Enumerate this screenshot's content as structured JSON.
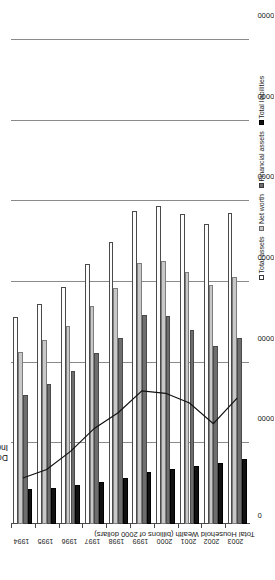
{
  "chart_data": {
    "type": "bar",
    "orientation": "horizontal-rotated",
    "title": "",
    "xlabel": "",
    "ylabel": "Total Household Wealth (billions of 2000 dollars)",
    "categories": [
      "1994",
      "1995",
      "1996",
      "1997",
      "1998",
      "1999",
      "2000",
      "2001",
      "2002",
      "2003"
    ],
    "ylim": [
      0,
      60000
    ],
    "yticks": [
      0,
      10000,
      20000,
      30000,
      40000,
      50000,
      60000
    ],
    "ytick_labels": [
      "0",
      "10000",
      "20000",
      "30000",
      "40000",
      "50000",
      "60000"
    ],
    "grid": true,
    "legend_position": "bottom-right",
    "series": [
      {
        "name": "Total assets",
        "swatch": "s0",
        "values": [
          25600,
          27300,
          29400,
          32200,
          35000,
          38800,
          39400,
          38400,
          37200,
          38600
        ]
      },
      {
        "name": "Net worth",
        "swatch": "s1",
        "values": [
          21300,
          22800,
          24600,
          27000,
          29300,
          32400,
          32600,
          31200,
          29600,
          30600
        ]
      },
      {
        "name": "Financial assets",
        "swatch": "s2",
        "values": [
          16000,
          17400,
          19000,
          21200,
          23100,
          25900,
          25800,
          24000,
          22100,
          23000
        ]
      },
      {
        "name": "Total liabilities",
        "swatch": "s3",
        "values": [
          4300,
          4500,
          4800,
          5200,
          5700,
          6400,
          6800,
          7200,
          7600,
          8000
        ]
      }
    ],
    "overlay_line": {
      "name": "Dow Jones Industrial Average",
      "label": "Dow Jones\nIndustrial Average",
      "x": [
        "1994",
        "1995",
        "1996",
        "1997",
        "1998",
        "1999",
        "2000",
        "2001",
        "2002",
        "2003"
      ],
      "values": [
        3800,
        4500,
        6000,
        7900,
        9200,
        11000,
        10800,
        10000,
        8300,
        10400
      ],
      "scale_max": 40000
    },
    "annotations": [
      {
        "text": "Dow Jones\nIndustrial Average",
        "anchor": "above-line-2001"
      }
    ]
  },
  "legend": {
    "items": [
      {
        "label": "Total assets",
        "swatch": "s0"
      },
      {
        "label": "Net worth",
        "swatch": "s1"
      },
      {
        "label": "Financial assets",
        "swatch": "s2"
      },
      {
        "label": "Total liabilities",
        "swatch": "s3"
      }
    ]
  },
  "axis": {
    "value_axis_title": "Total Household Wealth (billions of 2000 dollars)"
  }
}
